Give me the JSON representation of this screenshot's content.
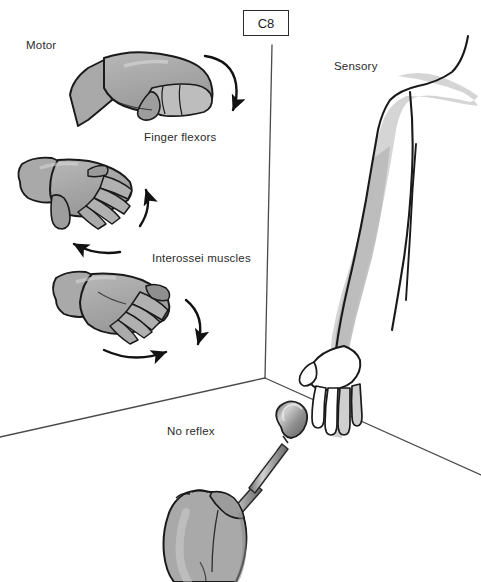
{
  "figure": {
    "width": 481,
    "height": 582,
    "background_color": "#ffffff"
  },
  "root_label": {
    "text": "C8",
    "border_color": "#2b2b2b",
    "text_color": "#1d1d1d"
  },
  "panels": {
    "motor": {
      "label": "Motor",
      "tests": [
        {
          "label": "Finger flexors",
          "icon": "fist-hand-icon",
          "motion": "finger flexion",
          "arrow_count": 1
        },
        {
          "label": "Interossei muscles",
          "icon": "spread-fingers-hand-icon",
          "motion": "finger abduction and adduction",
          "arrow_count": 3
        }
      ]
    },
    "sensory": {
      "label": "Sensory",
      "icon": "arm-dermatome-icon",
      "dermatome_region": "medial forearm and ulnar digits"
    },
    "reflex": {
      "label": "No reflex",
      "icon": "reflex-hammer-icon"
    }
  },
  "colors": {
    "outline": "#1a1a1a",
    "skin_fill": "#a9a9a9",
    "skin_fill_light": "#bdbdbd",
    "skin_shadow": "#8d8d8d",
    "highlight": "#cfcfcf",
    "dermatome_fill": "#d5d5d5",
    "dermatome_fill_dark": "#b6b6b6",
    "arm_fill": "#ffffff",
    "divider": "#4a4a4a",
    "hammer_metal": "#9a9a9a",
    "hammer_metal_light": "#c8c8c8",
    "hammer_metal_dark": "#6e6e6e",
    "text": "#2b2b2b"
  },
  "dividers": [
    {
      "name": "vertical-divider",
      "from": [
        272,
        45
      ],
      "to": [
        265,
        378
      ]
    },
    {
      "name": "lower-left-divider",
      "from": [
        265,
        378
      ],
      "to": [
        0,
        437
      ]
    },
    {
      "name": "lower-right-divider",
      "from": [
        265,
        378
      ],
      "to": [
        481,
        475
      ]
    }
  ]
}
